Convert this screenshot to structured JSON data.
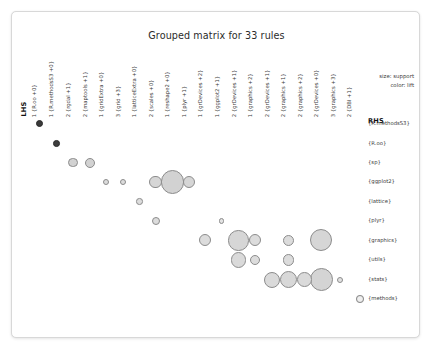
{
  "chart_data": {
    "type": "scatter",
    "title": "Grouped matrix for 33 rules",
    "xlabel": "LHS",
    "ylabel": "RHS",
    "legend": {
      "size": "size: support",
      "color": "color: lift",
      "size_text": "size",
      "color_text": "color",
      "size_encodes": "support",
      "color_encodes": "lift",
      "position": "top-right"
    },
    "grid": false,
    "x_axis_title": "LHS",
    "y_axis_title": "RHS",
    "categories_x": [
      "1 {R.oo +0}",
      "1 {R.methodsS3 +0}",
      "2 {rgdal +1}",
      "2 {maptools +1}",
      "1 {gridExtra +0}",
      "3 {grid +3}",
      "1 {latticeExtra +0}",
      "2 {scales +0}",
      "1 {reshape2 +0}",
      "1 {plyr +1}",
      "1 {grDevices +2}",
      "1 {ggplot2 +1}",
      "2 {grDevices +1}",
      "1 {graphics +2}",
      "2 {grDevices +1}",
      "2 {graphics +1}",
      "2 {graphics +2}",
      "2 {grDevices +0}",
      "3 {graphics +3}",
      "2 {DBI +1}"
    ],
    "categories_y": [
      "{R.methodsS3}",
      "{R.oo}",
      "{sp}",
      "{ggplot2}",
      "{lattice}",
      "{plyr}",
      "{graphics}",
      "{utils}",
      "{stats}",
      "{methods}"
    ],
    "colors": {
      "dark": "#3b3b3b",
      "mid": "#c9c9c9",
      "light": "#efefef",
      "stroke": "#8c8c8c",
      "text": "#3a3a3a"
    },
    "points": [
      {
        "x": "1 {R.oo +0}",
        "y": "{R.methodsS3}",
        "cx": 27.2,
        "cy": 111.6,
        "r": 3.6,
        "fill": "#3a3a3a",
        "lift": "high"
      },
      {
        "x": "1 {R.methodsS3 +0}",
        "y": "{R.oo}",
        "cx": 44.4,
        "cy": 131.2,
        "r": 3.4,
        "fill": "#3d3d3d",
        "lift": "high"
      },
      {
        "x": "2 {rgdal +1}",
        "y": "{sp}",
        "cx": 61.0,
        "cy": 150.6,
        "r": 4.6,
        "fill": "#d2d2d2",
        "lift": "low"
      },
      {
        "x": "2 {maptools +1}",
        "y": "{sp}",
        "cx": 77.8,
        "cy": 150.6,
        "r": 5.0,
        "fill": "#d2d2d2",
        "lift": "low"
      },
      {
        "x": "1 {gridExtra +0}",
        "y": "{ggplot2}",
        "cx": 94.2,
        "cy": 170.0,
        "r": 3.3,
        "fill": "#dcdcdc",
        "lift": "low"
      },
      {
        "x": "3 {grid +3}",
        "y": "{ggplot2}",
        "cx": 110.8,
        "cy": 170.0,
        "r": 3.3,
        "fill": "#dcdcdc",
        "lift": "low"
      },
      {
        "x": "1 {latticeExtra +0}",
        "y": "{lattice}",
        "cx": 127.4,
        "cy": 189.6,
        "r": 3.3,
        "fill": "#dcdcdc",
        "lift": "low"
      },
      {
        "x": "2 {scales +0}",
        "y": "{plyr}",
        "cx": 143.8,
        "cy": 209.0,
        "r": 4.1,
        "fill": "#dcdcdc",
        "lift": "low"
      },
      {
        "x": "2 {scales +0}",
        "y": "{ggplot2}",
        "cx": 143.8,
        "cy": 170.0,
        "r": 6.4,
        "fill": "#d6d6d6",
        "lift": "low"
      },
      {
        "x": "1 {reshape2 +0}",
        "y": "{ggplot2}",
        "cx": 160.4,
        "cy": 170.0,
        "r": 11.6,
        "fill": "#d2d2d2",
        "lift": "low"
      },
      {
        "x": "1 {plyr +1}",
        "y": "{ggplot2}",
        "cx": 177.0,
        "cy": 170.0,
        "r": 6.4,
        "fill": "#d6d6d6",
        "lift": "low"
      },
      {
        "x": "1 {grDevices +2}",
        "y": "{graphics}",
        "cx": 193.4,
        "cy": 228.4,
        "r": 6.1,
        "fill": "#dcdcdc",
        "lift": "low"
      },
      {
        "x": "1 {ggplot2 +1}",
        "y": "{plyr}",
        "cx": 209.8,
        "cy": 209.0,
        "r": 2.6,
        "fill": "#e2e2e2",
        "lift": "low"
      },
      {
        "x": "2 {grDevices +1}",
        "y": "{graphics}",
        "cx": 226.6,
        "cy": 228.4,
        "r": 10.2,
        "fill": "#d6d6d6",
        "lift": "low"
      },
      {
        "x": "2 {grDevices +1}",
        "y": "{utils}",
        "cx": 226.6,
        "cy": 248.0,
        "r": 7.6,
        "fill": "#dadada",
        "lift": "low"
      },
      {
        "x": "1 {graphics +2}",
        "y": "{utils}",
        "cx": 243.0,
        "cy": 248.0,
        "r": 5.2,
        "fill": "#dcdcdc",
        "lift": "low"
      },
      {
        "x": "1 {graphics +2}",
        "y": "{graphics}",
        "cx": 243.0,
        "cy": 228.4,
        "r": 6.1,
        "fill": "#dcdcdc",
        "lift": "low"
      },
      {
        "x": "2 {grDevices +1}",
        "y": "{stats}",
        "cx": 259.6,
        "cy": 267.6,
        "r": 8.1,
        "fill": "#dadada",
        "lift": "low"
      },
      {
        "x": "2 {graphics +1}",
        "y": "{utils}",
        "cx": 276.2,
        "cy": 248.0,
        "r": 5.6,
        "fill": "#dcdcdc",
        "lift": "low"
      },
      {
        "x": "2 {graphics +1}",
        "y": "{stats}",
        "cx": 276.2,
        "cy": 267.6,
        "r": 8.6,
        "fill": "#d8d8d8",
        "lift": "low"
      },
      {
        "x": "2 {graphics +2}",
        "y": "{stats}",
        "cx": 292.8,
        "cy": 267.6,
        "r": 7.4,
        "fill": "#dadada",
        "lift": "low"
      },
      {
        "x": "2 {graphics +2}",
        "y": "{graphics}",
        "cx": 276.2,
        "cy": 228.4,
        "r": 5.6,
        "fill": "#dcdcdc",
        "lift": "low"
      },
      {
        "x": "2 {grDevices +0}",
        "y": "{graphics}",
        "cx": 309.4,
        "cy": 228.4,
        "r": 11.0,
        "fill": "#d6d6d6",
        "lift": "low"
      },
      {
        "x": "3 {graphics +3}",
        "y": "{stats}",
        "cx": 309.4,
        "cy": 267.6,
        "r": 11.6,
        "fill": "#d4d4d4",
        "lift": "low"
      },
      {
        "x": "2 {DBI +1}",
        "y": "{stats}",
        "cx": 328.0,
        "cy": 267.6,
        "r": 3.1,
        "fill": "#e2e2e2",
        "lift": "low"
      },
      {
        "x": "3 {graphics +3}",
        "y": "{methods}",
        "cx": 348.0,
        "cy": 287.0,
        "r": 4.0,
        "fill": "#efefef",
        "lift": "low"
      }
    ]
  },
  "layout": {
    "col_label_x": [
      27.2,
      44.4,
      61.0,
      77.8,
      94.2,
      110.8,
      127.4,
      143.8,
      160.4,
      177.0,
      193.4,
      209.8,
      226.6,
      243.0,
      259.6,
      276.2,
      292.8,
      309.4,
      326.0,
      342.0
    ],
    "col_label_baseline_y": 104,
    "lhs_title_x": 16,
    "lhs_title_y": 104,
    "row_label_x": 356,
    "row_label_y": [
      111.6,
      131.2,
      150.6,
      170.0,
      189.6,
      209.0,
      228.4,
      248.0,
      267.6,
      287.0
    ],
    "rhs_title_x": 356,
    "rhs_title_y": 105,
    "legend_x": 402,
    "legend_y_size": 62,
    "legend_y_color": 71,
    "legend_bubble_cx": 348,
    "legend_bubble_cy": 287,
    "legend_bubble_r": 4.0
  }
}
